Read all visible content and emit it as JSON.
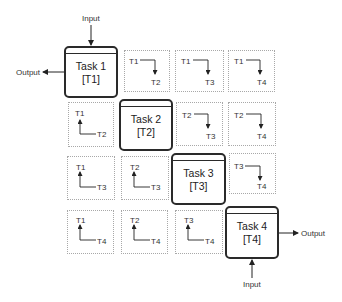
{
  "tasks": [
    {
      "title": "Task 1",
      "id": "[T1]"
    },
    {
      "title": "Task 2",
      "id": "[T2]"
    },
    {
      "title": "Task 3",
      "id": "[T3]"
    },
    {
      "title": "Task 4",
      "id": "[T4]"
    }
  ],
  "io": {
    "top_input": "Input",
    "top_output": "Output",
    "bottom_input": "Input",
    "bottom_output": "Output"
  },
  "dependencies": {
    "r1c2": {
      "from": "T1",
      "to": "T2",
      "direction": "down"
    },
    "r1c3": {
      "from": "T1",
      "to": "T3",
      "direction": "down"
    },
    "r1c4": {
      "from": "T1",
      "to": "T4",
      "direction": "down"
    },
    "r2c1": {
      "from": "T2",
      "to": "T1",
      "direction": "up",
      "top": "T1",
      "bottom": "T2"
    },
    "r2c3": {
      "from": "T2",
      "to": "T3",
      "direction": "down"
    },
    "r2c4": {
      "from": "T2",
      "to": "T4",
      "direction": "down"
    },
    "r3c1": {
      "top": "T1",
      "bottom": "T3",
      "direction": "up"
    },
    "r3c2": {
      "top": "T2",
      "bottom": "T3",
      "direction": "up"
    },
    "r3c4": {
      "from": "T3",
      "to": "T4",
      "direction": "down"
    },
    "r4c1": {
      "top": "T1",
      "bottom": "T4",
      "direction": "up"
    },
    "r4c2": {
      "top": "T2",
      "bottom": "T4",
      "direction": "up"
    },
    "r4c3": {
      "top": "T3",
      "bottom": "T4",
      "direction": "up"
    }
  },
  "colors": {
    "task_border": "#2a2a2a",
    "dep_border": "#a8a8a8",
    "text": "#222222"
  }
}
